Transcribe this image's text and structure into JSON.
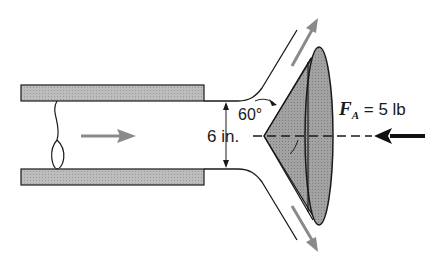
{
  "diagram": {
    "labels": {
      "angle": "60°",
      "jet_diameter": "6 in.",
      "force_symbol": "F",
      "force_subscript": "A",
      "force_value": " = 5 lb"
    },
    "elements": [
      "nozzle-top-wall",
      "nozzle-bottom-wall",
      "flow-direction-arrow",
      "jet-streamline-top",
      "jet-streamline-bottom",
      "conical-deflector",
      "deflected-flow-arrow-up",
      "deflected-flow-arrow-down",
      "centerline",
      "applied-force-arrow"
    ],
    "colors": {
      "wall_fill": "#b5b5b5",
      "cone_fill": "#8f8f8f",
      "cone_face_fill": "#9c9c9c",
      "flow_arrow": "#8a8a8a",
      "force_arrow": "#111111",
      "line": "#1a1a1a"
    }
  }
}
